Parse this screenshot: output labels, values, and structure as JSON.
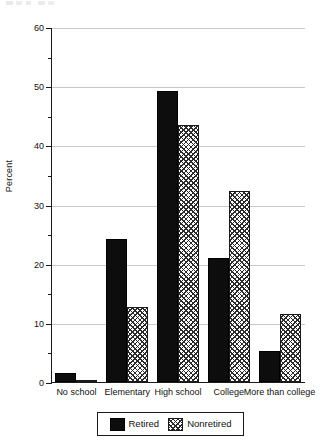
{
  "chart_data": {
    "type": "bar",
    "title": "",
    "xlabel": "",
    "ylabel": "Percent",
    "ylim": [
      0,
      60
    ],
    "ytick_labels": [
      "0",
      "10",
      "20",
      "30",
      "40",
      "50",
      "60"
    ],
    "ytick_values": [
      0,
      10,
      20,
      30,
      40,
      50,
      60
    ],
    "yminor_values": [
      5,
      15,
      25,
      35,
      45,
      55
    ],
    "grid": true,
    "legend_position": "bottom-center",
    "categories": [
      "No school",
      "Elementary",
      "High school",
      "College",
      "More than college"
    ],
    "series": [
      {
        "name": "Retired",
        "color": "#0d0d0d",
        "fill": "solid",
        "values": [
          1.6,
          24.2,
          49.2,
          20.9,
          5.3
        ]
      },
      {
        "name": "Nonretired",
        "color": "#2b2b2b",
        "fill": "crosshatch",
        "values": [
          0.4,
          12.6,
          43.4,
          32.3,
          11.5
        ]
      }
    ]
  },
  "legend": {
    "entries": [
      {
        "label": "Retired"
      },
      {
        "label": "Nonretired"
      }
    ]
  }
}
